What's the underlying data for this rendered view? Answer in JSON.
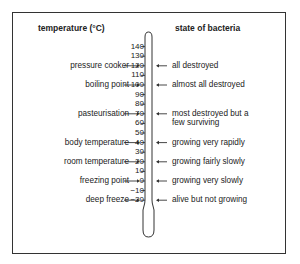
{
  "headers": {
    "left": "temperature (°C)",
    "right": "state of bacteria"
  },
  "scale": {
    "unit": "°C",
    "ticks": [
      140,
      130,
      120,
      110,
      100,
      90,
      80,
      70,
      60,
      50,
      40,
      30,
      20,
      10,
      0,
      -10,
      -20
    ],
    "tick_labels": [
      "140",
      "130",
      "120",
      "110",
      "100",
      "90",
      "80",
      "70",
      "60",
      "50",
      "40",
      "30",
      "20",
      "10",
      "0",
      "−10",
      "−20"
    ]
  },
  "left_labels": [
    {
      "text": "pressure cooker",
      "value": 120
    },
    {
      "text": "boiling point",
      "value": 100
    },
    {
      "text": "pasteurisation",
      "value": 70
    },
    {
      "text": "body temperature",
      "value": 40
    },
    {
      "text": "room temperature",
      "value": 20
    },
    {
      "text": "freezing point",
      "value": 0
    },
    {
      "text": "deep freeze",
      "value": -20
    }
  ],
  "right_labels": [
    {
      "text": "all destroyed",
      "value": 120
    },
    {
      "text": "almost all destroyed",
      "value": 100
    },
    {
      "text": "most destroyed but a",
      "text2": "few surviving",
      "value": 70
    },
    {
      "text": "growing very rapidly",
      "value": 40
    },
    {
      "text": "growing fairly slowly",
      "value": 20
    },
    {
      "text": "growing very slowly",
      "value": 0
    },
    {
      "text": "alive but not growing",
      "value": -20
    }
  ]
}
